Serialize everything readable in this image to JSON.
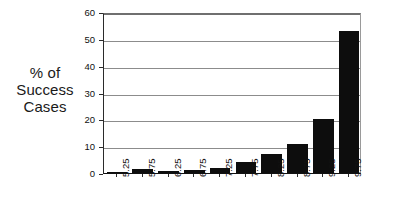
{
  "chart_data": {
    "type": "bar",
    "title": "",
    "subtitle": "",
    "xlabel": "",
    "ylabel": "% of Success Cases",
    "ylabel_lines": [
      "% of",
      "Success",
      "Cases"
    ],
    "categories": [
      "5.25",
      "5.75",
      "6.25",
      "6.75",
      "7.25",
      "7.75",
      "8.25",
      "8.75",
      "9.25",
      "9.75"
    ],
    "values": [
      0.2,
      1.6,
      0.7,
      1.3,
      2.0,
      4.0,
      7.0,
      10.8,
      20.0,
      53.0
    ],
    "ylim": [
      0,
      60
    ],
    "yticks": [
      0,
      10,
      20,
      30,
      40,
      50,
      60
    ],
    "ytick_labels": [
      "0",
      "10",
      "20",
      "30",
      "40",
      "50",
      "60"
    ],
    "grid": true,
    "grid_axis": "y",
    "legend": false,
    "legend_position": "none",
    "bar_color": "#0d0d0d",
    "grid_color": "#8c8c8c",
    "axis_color": "#111111",
    "background_color": "#ffffff",
    "xtick_rotation": 90
  }
}
